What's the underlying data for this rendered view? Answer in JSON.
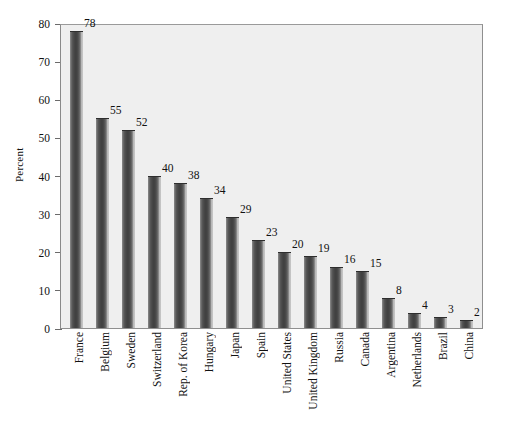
{
  "chart_data": {
    "type": "bar",
    "title": "",
    "subtitle": "",
    "xlabel": "",
    "ylabel": "Percent",
    "ylim": [
      0,
      80
    ],
    "ytick_step": 10,
    "yticks": [
      0,
      10,
      20,
      30,
      40,
      50,
      60,
      70,
      80
    ],
    "ytick_labels": [
      "0",
      "10",
      "20",
      "30",
      "40",
      "50",
      "60",
      "70",
      "80"
    ],
    "grid": false,
    "legend": null,
    "bar_color": "#474747",
    "plot_background": "#efefef",
    "page_background": "#ffffff",
    "axis_color": "#8f8f8f",
    "categories": [
      "France",
      "Belgium",
      "Sweden",
      "Switzerland",
      "Rep. of Korea",
      "Hungary",
      "Japan",
      "Spain",
      "United States",
      "United Kingdom",
      "Russia",
      "Canada",
      "Argentina",
      "Netherlands",
      "Brazil",
      "China"
    ],
    "values": [
      78,
      55,
      52,
      40,
      38,
      34,
      29,
      23,
      20,
      19,
      16,
      15,
      8,
      4,
      3,
      2
    ],
    "value_labels": [
      "78",
      "55",
      "52",
      "40",
      "38",
      "34",
      "29",
      "23",
      "20",
      "19",
      "16",
      "15",
      "8",
      "4",
      "3",
      "2"
    ]
  }
}
